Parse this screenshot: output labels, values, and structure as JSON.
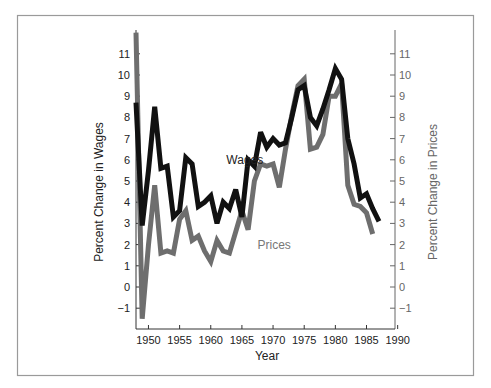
{
  "chart_data": {
    "type": "line",
    "title": "",
    "xlabel": "Year",
    "ylabel": "Percent Change in Wages",
    "ylabel_right": "Percent Change in Prices",
    "xlim": [
      1948,
      1990
    ],
    "ylim": [
      -2,
      12
    ],
    "x_ticks": [
      1950,
      1955,
      1960,
      1965,
      1970,
      1975,
      1980,
      1985,
      1990
    ],
    "y_ticks": [
      -1,
      0,
      1,
      2,
      3,
      4,
      5,
      6,
      7,
      8,
      9,
      10,
      11
    ],
    "y_tick_labels": [
      "−1",
      "0",
      "1",
      "2",
      "3",
      "4",
      "5",
      "6",
      "7",
      "8",
      "9",
      "10",
      "11"
    ],
    "grid": false,
    "legend": "inline labels",
    "series": [
      {
        "name": "Wages",
        "color": "#111111",
        "label_pos": {
          "year": 1962.5,
          "value": 6.0
        },
        "x": [
          1948,
          1949,
          1950,
          1951,
          1952,
          1953,
          1954,
          1955,
          1956,
          1957,
          1958,
          1959,
          1960,
          1961,
          1962,
          1963,
          1964,
          1965,
          1966,
          1967,
          1968,
          1969,
          1970,
          1971,
          1972,
          1973,
          1974,
          1975,
          1976,
          1977,
          1978,
          1979,
          1980,
          1981,
          1982,
          1983,
          1984,
          1985,
          1986,
          1987
        ],
        "values": [
          8.7,
          2.9,
          5.5,
          8.5,
          5.6,
          5.7,
          3.3,
          3.6,
          6.1,
          5.8,
          3.8,
          4.0,
          4.3,
          3.0,
          4.0,
          3.7,
          4.6,
          3.3,
          6.0,
          5.7,
          7.3,
          6.6,
          7.0,
          6.7,
          6.8,
          8.0,
          9.3,
          9.5,
          8.0,
          7.6,
          8.4,
          9.3,
          10.3,
          9.8,
          7.0,
          5.8,
          4.2,
          4.4,
          3.7,
          3.1
        ]
      },
      {
        "name": "Prices",
        "color": "#6e6e6e",
        "label_pos": {
          "year": 1967.5,
          "value": 2.0
        },
        "x": [
          1948,
          1949,
          1950,
          1951,
          1952,
          1953,
          1954,
          1955,
          1956,
          1957,
          1958,
          1959,
          1960,
          1961,
          1962,
          1963,
          1964,
          1965,
          1966,
          1967,
          1968,
          1969,
          1970,
          1971,
          1972,
          1973,
          1974,
          1975,
          1976,
          1977,
          1978,
          1979,
          1980,
          1981,
          1982,
          1983,
          1984,
          1985,
          1986
        ],
        "values": [
          12.0,
          -1.5,
          2.0,
          4.8,
          1.6,
          1.7,
          1.6,
          3.2,
          3.6,
          2.2,
          2.4,
          1.7,
          1.2,
          2.2,
          1.7,
          1.6,
          2.6,
          3.6,
          2.7,
          5.0,
          5.8,
          5.7,
          5.8,
          4.7,
          6.5,
          8.1,
          9.5,
          9.8,
          6.5,
          6.6,
          7.2,
          9.0,
          9.0,
          9.6,
          4.8,
          3.9,
          3.8,
          3.5,
          2.5
        ]
      }
    ]
  },
  "colors": {
    "wages_line": "#111111",
    "prices_line": "#6e6e6e",
    "frame": "#9a9a9a",
    "right_axis_text": "#666666"
  }
}
